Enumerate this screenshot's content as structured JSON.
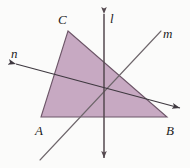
{
  "figure": {
    "background_color": "#fbfbfa",
    "width": 190,
    "height": 168
  },
  "triangle": {
    "name": "triangle-ABC",
    "fill_color": "#c7a9c2",
    "stroke_color": "#6d5668",
    "vertices": [
      {
        "label": "C",
        "x": 68,
        "y": 31
      },
      {
        "label": "B",
        "x": 167,
        "y": 117
      },
      {
        "label": "A",
        "x": 41,
        "y": 117
      }
    ]
  },
  "lines": [
    {
      "label": "l",
      "name": "line-l",
      "orientation": "vertical",
      "color": "#54494f",
      "x1": 104,
      "y1": 14,
      "x2": 104,
      "y2": 158,
      "arrow_start": true,
      "arrow_end": true
    },
    {
      "label": "m",
      "name": "line-m",
      "orientation": "diagonal-rising",
      "color": "#6e666b",
      "x1": 40,
      "y1": 160,
      "x2": 161,
      "y2": 31,
      "arrow_start": false,
      "arrow_end": false
    },
    {
      "label": "n",
      "name": "line-n",
      "orientation": "diagonal-falling",
      "color": "#3f3940",
      "x1": 16,
      "y1": 64,
      "x2": 180,
      "y2": 108,
      "arrow_start": true,
      "arrow_end": true
    }
  ],
  "intersection_point": {
    "x": 104,
    "y": 88
  },
  "labels": {
    "vertex_C": "C",
    "vertex_A": "A",
    "vertex_B": "B",
    "line_l": "l",
    "line_m": "m",
    "line_n": "n"
  }
}
